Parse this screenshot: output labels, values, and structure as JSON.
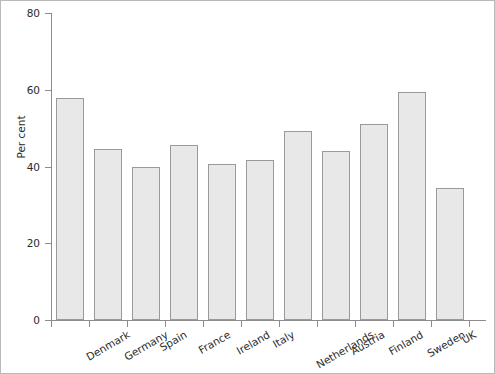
{
  "chart_data": {
    "type": "bar",
    "title": "",
    "subtitle": "",
    "xlabel": "",
    "ylabel": "Per cent",
    "ylim": [
      0,
      80
    ],
    "yticks": [
      0,
      20,
      40,
      60,
      80
    ],
    "grid": false,
    "legend": false,
    "categories": [
      "Denmark",
      "Germany",
      "Spain",
      "France",
      "Ireland",
      "Italy",
      "Netherlands",
      "Austria",
      "Finland",
      "Sweden",
      "UK"
    ],
    "values": [
      57.9,
      44.5,
      39.9,
      45.6,
      40.7,
      41.6,
      49.2,
      44.1,
      51.2,
      59.5,
      34.4
    ],
    "bar_fill_color": "#e8e8e8",
    "bar_border_color": "#9a9a9a",
    "axis_color": "#8c8c8c",
    "text_color": "#2b2b2b"
  }
}
